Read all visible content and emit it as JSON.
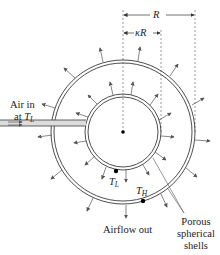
{
  "diagram": {
    "title": "",
    "labels": {
      "R": "R",
      "kappa_R": "κR",
      "air_in_line1": "Air in",
      "air_in_line2_prefix": "at ",
      "air_in_T": "T",
      "air_in_T_sub": "L",
      "T_L": "T",
      "T_L_sub": "L",
      "T_H": "T",
      "T_H_sub": "H",
      "airflow_out": "Airflow out",
      "porous_line1": "Porous",
      "porous_line2": "spherical",
      "porous_line3": "shells"
    },
    "geometry": {
      "center": [
        123,
        132
      ],
      "outer_radius": 72,
      "inner_radius": 38,
      "shell_gap": 3
    },
    "colors": {
      "stroke": "#3a3a3a",
      "pipe_fill": "#dcdcdc",
      "arrow": "#555555",
      "dot": "#000000"
    }
  }
}
